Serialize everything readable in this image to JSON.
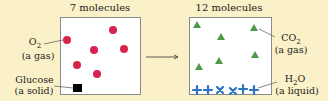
{
  "left_panel": {
    "title": "7 molecules",
    "o2_label": "O",
    "o2_sub": "2",
    "o2_state": "(a gas)",
    "glucose_label": "Glucose",
    "glucose_state": "(a solid)"
  },
  "right_panel": {
    "title": "12 molecules",
    "co2_label": "CO",
    "co2_sub": "2",
    "co2_state": "(a gas)",
    "h2o_label_h": "H",
    "h2o_sub": "2",
    "h2o_label_o": "O",
    "h2o_state": "(a liquid)"
  },
  "colors": {
    "background": "#fbf1c8",
    "o2": "#d6244e",
    "glucose": "#000000",
    "co2": "#4e9a4a",
    "h2o": "#2a74c2"
  }
}
